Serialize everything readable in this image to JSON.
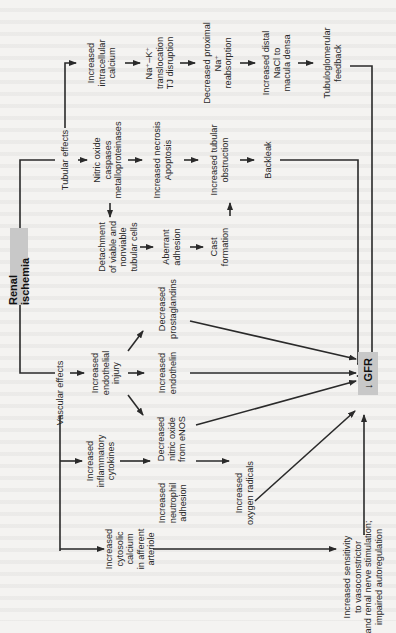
{
  "diagram": {
    "orientation": "rotated-90-ccw",
    "root": "Renal ischemia",
    "target": "GFR",
    "target_prefix": "↓",
    "branches": {
      "tubular": "Tubular effects",
      "vascular": "Vascular effects"
    },
    "nodes": {
      "inc_intracellular_ca": "Increased\nintracellular\ncalcium",
      "na_k_translocation": "Na⁺–K⁺\ntranslocation\nTJ disruption",
      "dec_prox_na": "Decreased proximal\nNa⁺\nreabsorption",
      "inc_distal_nacl": "Increased distal\nNaCl to\nmacula densa",
      "tg_feedback": "Tubuloglomerular\nfeedback",
      "no_caspases": "Nitric oxide\ncaspases\nmetalloproteinases",
      "necrosis_apoptosis": "Increased necrosis\nApoptosis",
      "tubular_obstruction": "Increased tubular\nobstruction",
      "backleak": "Backleak",
      "detachment": "Detachment\nof viable and\nnonviable\ntubular cells",
      "aberrant_adhesion": "Aberrant\nadhesion",
      "cast_formation": "Cast\nformation",
      "endothelial_injury": "Increased\nendothelial\ninjury",
      "dec_prostaglandins": "Decreased\nprostaglandins",
      "inc_endothelin": "Increased\nendothelin",
      "dec_no_enos": "Decreased\nnitric oxide\nfrom eNOS",
      "inflammatory_cytokines": "Increased\ninflammatory\ncytokines",
      "neutrophil_adhesion": "Increased\nneutrophil\nadhesion",
      "oxygen_radicals": "Increased\noxygen radicals",
      "cytosolic_ca": "Increased\ncytosolic\ncalcium\nin afferent\narteriole",
      "vasoconstrictor_sensitivity": "Increased sensitivity\nto vasoconstrictor\nand renal nerve stimulation;\nimpaired autoregulation"
    },
    "colors": {
      "box_fill": "#c8c8c8",
      "line": "#2a2a2a",
      "background": "#f4f3f1"
    }
  }
}
